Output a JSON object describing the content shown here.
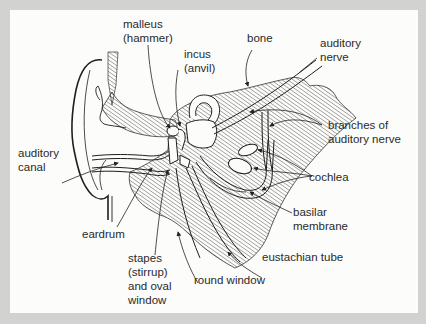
{
  "figure": {
    "colors": {
      "background_frame": "#d2d2d0",
      "panel": "#fcfcfb",
      "ink": "#2a2a2a",
      "hatch": "#555555"
    },
    "labels": {
      "malleus": {
        "line1": "malleus",
        "line2": "(hammer)"
      },
      "incus": {
        "line1": "incus",
        "line2": "(anvil)"
      },
      "bone": {
        "line1": "bone"
      },
      "auditory_nerve": {
        "line1": "auditory",
        "line2": "nerve"
      },
      "branches": {
        "line1": "branches of",
        "line2": "auditory nerve"
      },
      "auditory_canal": {
        "line1": "auditory",
        "line2": "canal"
      },
      "cochlea": {
        "line1": "cochlea"
      },
      "basilar": {
        "line1": "basilar",
        "line2": "membrane"
      },
      "eardrum": {
        "line1": "eardrum"
      },
      "eustachian": {
        "line1": "eustachian tube"
      },
      "stapes": {
        "line1": "stapes",
        "line2": "(stirrup)",
        "line3": "and oval",
        "line4": "window"
      },
      "round_window": {
        "line1": "round window"
      }
    }
  }
}
